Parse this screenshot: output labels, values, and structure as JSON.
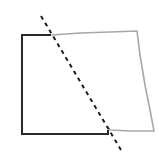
{
  "diagram": {
    "colors": {
      "background": "#ffffff",
      "solid_edge": "#2a2a2a",
      "rough_edge": "#a8a8a8",
      "fold_line": "#1e1e1e"
    },
    "solid_part_points": "51,35 22,35 22,134 108,134 108,130",
    "rough_part_points": "52,35 80,33 110,32 137,31 140,55 145,85 150,110 154,131 130,131 110,130 108,127",
    "fold_line": {
      "x1": 41,
      "y1": 16,
      "x2": 121,
      "y2": 150,
      "dash": "4 4"
    }
  }
}
